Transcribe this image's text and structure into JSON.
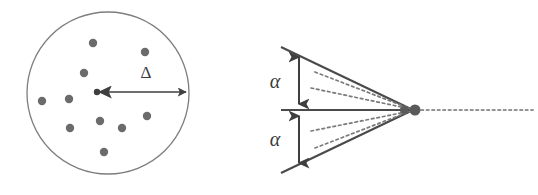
{
  "figure": {
    "background_color": "#ffffff",
    "ink_color": "#4a4a4a",
    "dot_color": "#6b6b6b",
    "outline_color": "#7d7d7d",
    "panels": [
      {
        "id": "left-panel",
        "name": "scattering-centers-circle",
        "circle": {
          "cx": 108,
          "cy": 93,
          "r": 81
        },
        "center_dot": {
          "cx": 97,
          "cy": 92,
          "r": 3.2
        },
        "arrow": {
          "x1": 97,
          "y1": 92,
          "x2": 189,
          "y2": 92
        },
        "label": {
          "text": "Δ",
          "name": "delta-label",
          "x": 146,
          "y": 78
        },
        "dots": [
          {
            "cx": 93,
            "cy": 43,
            "r": 4.2
          },
          {
            "cx": 145,
            "cy": 52,
            "r": 4.2
          },
          {
            "cx": 84,
            "cy": 73,
            "r": 4.2
          },
          {
            "cx": 42,
            "cy": 101,
            "r": 4.2
          },
          {
            "cx": 69,
            "cy": 99,
            "r": 4.2
          },
          {
            "cx": 70,
            "cy": 128,
            "r": 4.2
          },
          {
            "cx": 100,
            "cy": 121,
            "r": 4.2
          },
          {
            "cx": 147,
            "cy": 116,
            "r": 4.2
          },
          {
            "cx": 122,
            "cy": 128,
            "r": 4.2
          },
          {
            "cx": 104,
            "cy": 152,
            "r": 4.2
          }
        ]
      },
      {
        "id": "right-panel",
        "name": "scattering-cone",
        "apex": {
          "cx": 415,
          "cy": 110,
          "r": 5.5
        },
        "secondary_dot": {
          "cx": 404,
          "cy": 110,
          "r": 4.0
        },
        "cone_edges": [
          {
            "x1": 281,
            "y1": 47,
            "x2": 413,
            "y2": 110
          },
          {
            "x1": 281,
            "y1": 173,
            "x2": 413,
            "y2": 110
          }
        ],
        "axis_line": {
          "x1": 281,
          "y1": 110,
          "x2": 413,
          "y2": 110
        },
        "dashed_rays": [
          {
            "x1": 315,
            "y1": 72,
            "x2": 411,
            "y2": 109
          },
          {
            "x1": 311,
            "y1": 88,
            "x2": 411,
            "y2": 109
          },
          {
            "x1": 311,
            "y1": 131,
            "x2": 411,
            "y2": 111
          },
          {
            "x1": 315,
            "y1": 148,
            "x2": 411,
            "y2": 111
          }
        ],
        "dashed_tail": {
          "x1": 420,
          "y1": 110,
          "x2": 533,
          "y2": 110
        },
        "angle_arrows": [
          {
            "name": "alpha-arrow-upper",
            "x": 299,
            "y1": 53,
            "y2": 108
          },
          {
            "name": "alpha-arrow-lower",
            "x": 299,
            "y1": 112,
            "y2": 167
          }
        ],
        "labels": [
          {
            "text": "α",
            "name": "alpha-label-upper",
            "x": 275,
            "y": 88
          },
          {
            "text": "α",
            "name": "alpha-label-lower",
            "x": 275,
            "y": 146
          }
        ]
      }
    ]
  }
}
